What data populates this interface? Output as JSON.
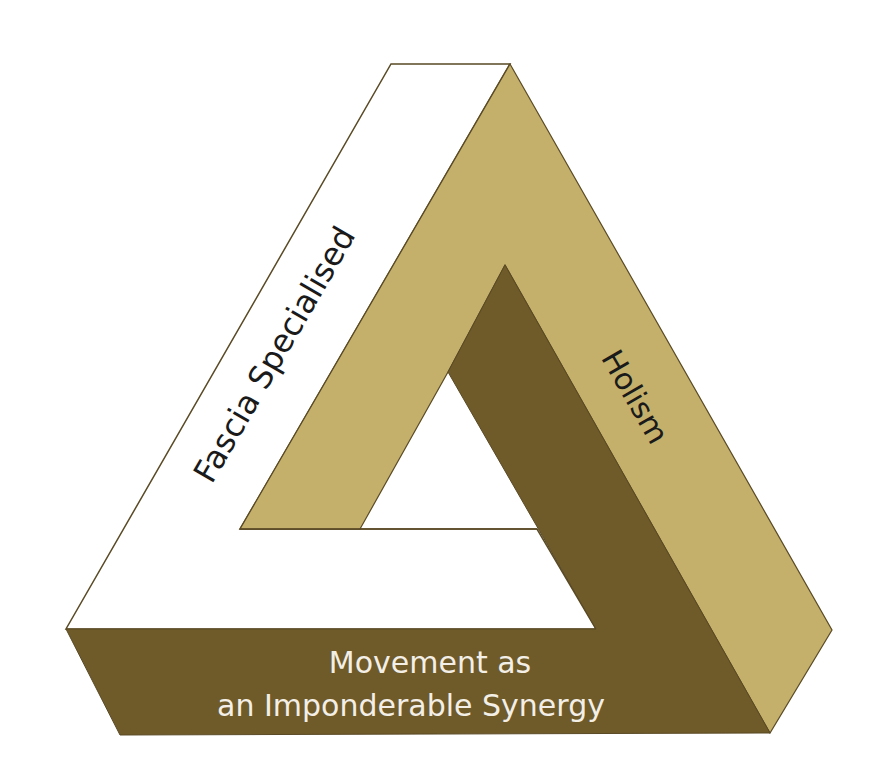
{
  "diagram": {
    "type": "impossible-triangle",
    "sides": {
      "left": {
        "label": "Fascia Specialised",
        "fill": "#ffffff",
        "text_color": "#1a1a1a"
      },
      "right": {
        "label": "Holism",
        "fill": "#c4b06a",
        "text_color": "#1a1a1a"
      },
      "bottom": {
        "line1": "Movement as",
        "line2": "an Imponderable Synergy",
        "fill": "#6f5a2a",
        "text_color": "#f3efe6"
      }
    },
    "colors": {
      "outline": "#5a4a25",
      "background": "#ffffff"
    }
  }
}
